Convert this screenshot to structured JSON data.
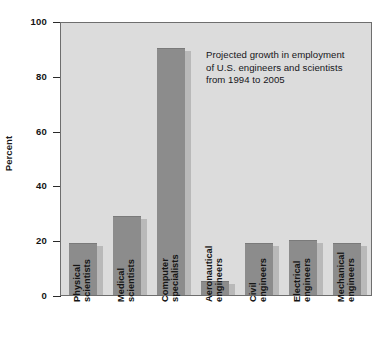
{
  "chart_data": {
    "type": "bar",
    "title": "",
    "xlabel": "",
    "ylabel": "Percent",
    "ylim": [
      0,
      100
    ],
    "yticks": [
      0,
      20,
      40,
      60,
      80,
      100
    ],
    "grid": false,
    "legend": null,
    "categories": [
      "Physical scientists",
      "Medical scientists",
      "Computer specialists",
      "Aeronautical engineers",
      "Civil engineers",
      "Electrical engineers",
      "Mechanical engineers"
    ],
    "category_lines": [
      [
        "Physical",
        "scientists"
      ],
      [
        "Medical",
        "scientists"
      ],
      [
        "Computer",
        "specialists"
      ],
      [
        "Aeronautical",
        "engineers"
      ],
      [
        "Civil",
        "engineers"
      ],
      [
        "Electrical",
        "engineers"
      ],
      [
        "Mechanical",
        "engineers"
      ]
    ],
    "values": [
      19,
      29,
      90,
      5,
      19,
      20,
      19
    ],
    "annotations": [
      "Projected growth in employment",
      "of U.S. engineers and scientists",
      "from 1994 to 2005"
    ],
    "colors": {
      "bar": "#8c8c8c",
      "bar_shadow": "#b9b9b9",
      "plot_background": "#dcdcdc",
      "axis": "#6e6e6e",
      "text": "#141414",
      "page_background": "#ffffff"
    }
  }
}
